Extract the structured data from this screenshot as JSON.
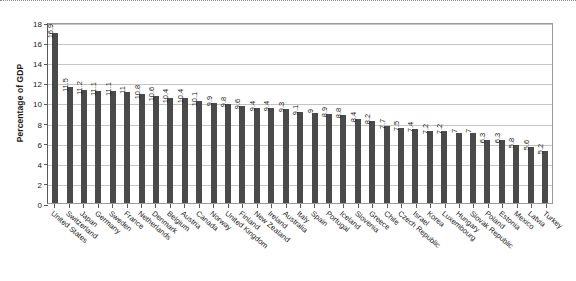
{
  "chart_data": {
    "type": "bar",
    "title": "",
    "xlabel": "",
    "ylabel": "Percentage of GDP",
    "ylim": [
      0,
      18
    ],
    "yticks": [
      0,
      2,
      4,
      6,
      8,
      10,
      12,
      14,
      16,
      18
    ],
    "grid": true,
    "legend": "none",
    "bar_color": "#4a4a4a",
    "categories": [
      "United States",
      "Switzerland",
      "Japan",
      "Germany",
      "Sweden",
      "France",
      "Netherlands",
      "Denmark",
      "Belgium",
      "Austria",
      "Canada",
      "Norway",
      "United Kingdom",
      "Finland",
      "New Zealand",
      "Ireland",
      "Australia",
      "Italy",
      "Spain",
      "Portugal",
      "Iceland",
      "Slovenia",
      "Greece",
      "Chile",
      "Czech Republic",
      "Israel",
      "Korea",
      "Luxembourg",
      "Hungary",
      "Slovak Republic",
      "Poland",
      "Estonia",
      "Mexico",
      "Latvia",
      "Turkey"
    ],
    "values": [
      16.9,
      11.5,
      11.2,
      11.1,
      11.1,
      11,
      10.8,
      10.6,
      10.4,
      10.4,
      10.1,
      9.9,
      9.8,
      9.6,
      9.4,
      9.4,
      9.3,
      9.1,
      9,
      8.9,
      8.8,
      8.4,
      8.2,
      7.7,
      7.5,
      7.4,
      7.2,
      7.2,
      7,
      7,
      6.3,
      6.3,
      5.8,
      5.6,
      5.2
    ],
    "value_labels": [
      "16.9",
      "11.5",
      "11.2",
      "11.1",
      "11.1",
      "11",
      "10.8",
      "10.6",
      "10.4",
      "10.4",
      "10.1",
      "9.9",
      "9.8",
      "9.6",
      "9.4",
      "9.4",
      "9.3",
      "9.1",
      "9",
      "8.9",
      "8.8",
      "8.4",
      "8.2",
      "7.7",
      "7.5",
      "7.4",
      "7.2",
      "7.2",
      "7",
      "7",
      "6.3",
      "6.3",
      "5.8",
      "5.6",
      "5.2"
    ]
  }
}
